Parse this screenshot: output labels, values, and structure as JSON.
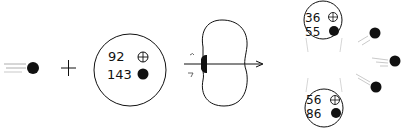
{
  "incoming_neutron": {
    "label": "neutron"
  },
  "plus_sign": "+",
  "target_nucleus": {
    "protons": "92",
    "neutrons": "143"
  },
  "compound_nucleus": {
    "state": "deformed / splitting",
    "arrow": "fission axis"
  },
  "fragments": [
    {
      "protons": "36",
      "neutrons": "55"
    },
    {
      "protons": "56",
      "neutrons": "86"
    }
  ],
  "emitted_neutrons": 3,
  "legend": {
    "proton_symbol": "⊕",
    "neutron_symbol": "●"
  },
  "colors": {
    "line": "#111111",
    "neutron": "#111111",
    "background": "#ffffff"
  }
}
